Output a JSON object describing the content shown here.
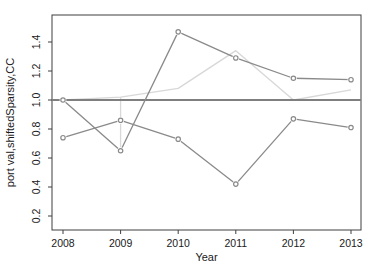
{
  "figure": {
    "background": "#ffffff"
  },
  "chart_data": {
    "type": "line",
    "title": "",
    "xlabel": "Year",
    "ylabel": "port val,shiftedSparsity,CC",
    "x": [
      2008,
      2009,
      2010,
      2011,
      2012,
      2013
    ],
    "xticks": [
      2008,
      2009,
      2010,
      2011,
      2012,
      2013
    ],
    "yticks": [
      0.2,
      0.4,
      0.6,
      0.8,
      1.0,
      1.2,
      1.4
    ],
    "ylim": [
      0.1,
      1.59
    ],
    "xlim": [
      2007.8,
      2013.2
    ],
    "grid": false,
    "legend": "none",
    "series": [
      {
        "name": "upper-gray-series",
        "color": "#8a8a8a",
        "marker": "circle-open",
        "width": 1.3,
        "values": [
          1.0,
          0.65,
          1.47,
          1.29,
          1.15,
          1.14
        ]
      },
      {
        "name": "lower-gray-series",
        "color": "#8a8a8a",
        "marker": "circle-open",
        "width": 1.3,
        "values": [
          0.74,
          0.86,
          0.73,
          0.42,
          0.87,
          0.81
        ]
      },
      {
        "name": "light-gray-series",
        "color": "#d8d8d8",
        "marker": "none",
        "width": 1.4,
        "values": [
          1.0,
          1.02,
          1.08,
          1.34,
          1.0,
          1.07
        ]
      }
    ],
    "reference_line": {
      "y": 1.0,
      "color": "#7f7f7f",
      "width": 2.2
    },
    "connector_segment": {
      "x": 2009,
      "y1": 0.65,
      "y2": 1.02,
      "color": "#d8d8d8",
      "width": 1.3
    },
    "style": {
      "box_color": "#3f3f3f",
      "tick_color": "#3f3f3f",
      "text_color": "#1a1a1a"
    }
  }
}
